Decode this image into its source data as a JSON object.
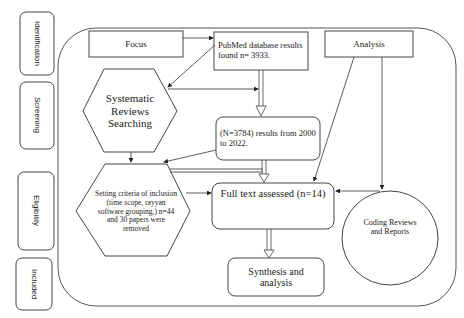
{
  "stages": [
    {
      "label": "Identification"
    },
    {
      "label": "Screening"
    },
    {
      "label": "Eligibility"
    },
    {
      "label": "Included"
    }
  ],
  "nodes": {
    "focus": {
      "label": "Focus"
    },
    "pubmed": {
      "label": "PubMed database results found n= 3933."
    },
    "analysis": {
      "label": "Analysis"
    },
    "systematic": {
      "label": "Systematic Reviews Searching"
    },
    "range": {
      "label": "(N=3784) results from 2000 to 2022."
    },
    "criteria": {
      "label": "Setting criteria of inclusion (time scope, rayyan software grouping,) n=44 and 30 papers were removed"
    },
    "fulltext": {
      "label": "Full text assessed (n=14)"
    },
    "coding": {
      "label": "Coding Reviews and Reports"
    },
    "synthesis": {
      "label": "Synthesis and analysis"
    }
  },
  "colors": {
    "stroke": "#3a3a3a",
    "background": "#ffffff"
  }
}
